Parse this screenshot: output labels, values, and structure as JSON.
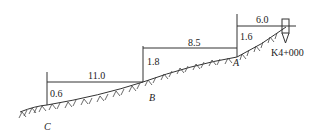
{
  "diagram": {
    "type": "terrain-profile-cross-section",
    "station": "K4+000",
    "points": [
      {
        "name": "A",
        "label": "A"
      },
      {
        "name": "B",
        "label": "B"
      },
      {
        "name": "C",
        "label": "C"
      }
    ],
    "horizontal_distances": {
      "station_to_A": "6.0",
      "A_to_B": "8.5",
      "B_to_C": "11.0"
    },
    "height_differences": {
      "A": "1.6",
      "B": "1.8",
      "C": "0.6"
    }
  }
}
